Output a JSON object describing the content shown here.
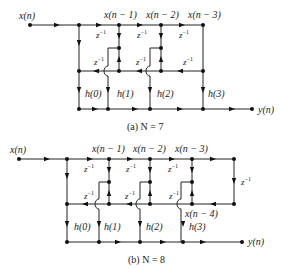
{
  "diagrams": [
    {
      "id": "a",
      "caption": "(a) N = 7",
      "input_label": "x(n)",
      "output_label": "y(n)",
      "tap_labels": [
        "x(n − 1)",
        "x(n − 2)",
        "x(n − 3)"
      ],
      "delay_label": "z",
      "delay_exp": "−1",
      "coeff_labels": [
        "h(0)",
        "h(1)",
        "h(2)",
        "h(3)"
      ]
    },
    {
      "id": "b",
      "caption": "(b) N = 8",
      "input_label": "x(n)",
      "output_label": "y(n)",
      "tap_labels": [
        "x(n − 1)",
        "x(n − 2)",
        "x(n − 3)"
      ],
      "extra_tap_label": "x(n − 4)",
      "delay_label": "z",
      "delay_exp": "−1",
      "coeff_labels": [
        "h(0)",
        "h(1)",
        "h(2)",
        "h(3)"
      ]
    }
  ]
}
